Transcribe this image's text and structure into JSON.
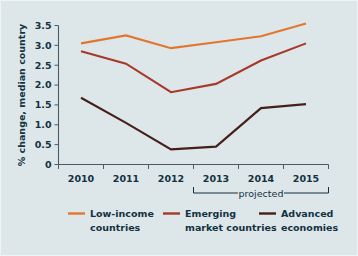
{
  "figure": {
    "background_color": "#dde7ea",
    "text_color": "#14313f",
    "axis_color": "#4a5b66"
  },
  "chart_data": {
    "type": "line",
    "title": "",
    "subtitle": "",
    "xlabel": "",
    "ylabel": "% change, median country",
    "categories": [
      "2010",
      "2011",
      "2012",
      "2013",
      "2014",
      "2015"
    ],
    "ylim": [
      0,
      3.5
    ],
    "ytick_labels": [
      "0",
      "0.5",
      "1.0",
      "1.5",
      "2.0",
      "2.5",
      "3.0",
      "3.5"
    ],
    "ytick_values": [
      0,
      0.5,
      1.0,
      1.5,
      2.0,
      2.5,
      3.0,
      3.5
    ],
    "grid": false,
    "legend_position": "bottom",
    "annotations": [
      {
        "text": "projected",
        "spans_categories": [
          "2013",
          "2015"
        ]
      }
    ],
    "series": [
      {
        "name": "Low-income countries",
        "color": "#e3762c",
        "values": [
          3.05,
          3.25,
          2.93,
          3.08,
          3.23,
          3.55
        ]
      },
      {
        "name": "Emerging market countries",
        "color": "#a8382a",
        "values": [
          2.85,
          2.54,
          1.82,
          2.03,
          2.62,
          3.05
        ]
      },
      {
        "name": "Advanced economies",
        "color": "#45201a",
        "values": [
          1.68,
          1.05,
          0.38,
          0.45,
          1.42,
          1.52
        ]
      }
    ]
  },
  "legend": {
    "items": [
      {
        "label_line1": "Low-income",
        "label_line2": "countries",
        "color": "#e3762c"
      },
      {
        "label_line1": "Emerging",
        "label_line2": "market countries",
        "color": "#a8382a"
      },
      {
        "label_line1": "Advanced",
        "label_line2": "economies",
        "color": "#45201a"
      }
    ]
  }
}
